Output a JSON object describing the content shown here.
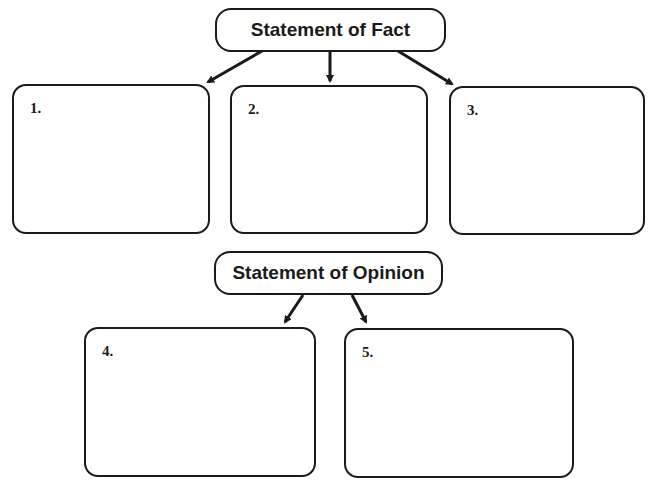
{
  "diagram": {
    "fact_heading": "Statement of Fact",
    "opinion_heading": "Statement of Opinion",
    "fact_boxes": [
      {
        "number": "1."
      },
      {
        "number": "2."
      },
      {
        "number": "3."
      }
    ],
    "opinion_boxes": [
      {
        "number": "4."
      },
      {
        "number": "5."
      }
    ]
  }
}
